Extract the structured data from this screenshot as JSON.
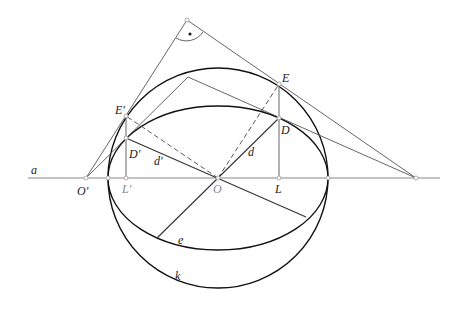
{
  "diagram": {
    "title": "",
    "labels": {
      "axis": "a",
      "O_prime": "O′",
      "L_prime": "L′",
      "O": "O",
      "L": "L",
      "E_prime": "E′",
      "D_prime": "D′",
      "E": "E",
      "D": "D",
      "d_prime": "d′",
      "d": "d",
      "ellipse": "e",
      "circle": "k",
      "right_angle_marker": "•"
    },
    "points": {
      "O": [
        218,
        178
      ],
      "O_prime": [
        86,
        178
      ],
      "L": [
        279,
        178
      ],
      "L_prime": [
        126,
        178
      ],
      "E": [
        279,
        84
      ],
      "E_prime": [
        126,
        116
      ],
      "D": [
        279,
        118
      ],
      "D_prime": [
        126,
        138
      ],
      "apex_right_angle": [
        187,
        20
      ],
      "apex_inner": [
        188,
        77
      ],
      "far_right": [
        416,
        178
      ],
      "circle_left": [
        108,
        178
      ],
      "circle_right": [
        328,
        178
      ]
    },
    "circle_k": {
      "cx": 218,
      "cy": 178,
      "r": 110
    },
    "ellipse_e": {
      "cx": 218,
      "cy": 178,
      "rx": 110,
      "ry": 72
    }
  }
}
